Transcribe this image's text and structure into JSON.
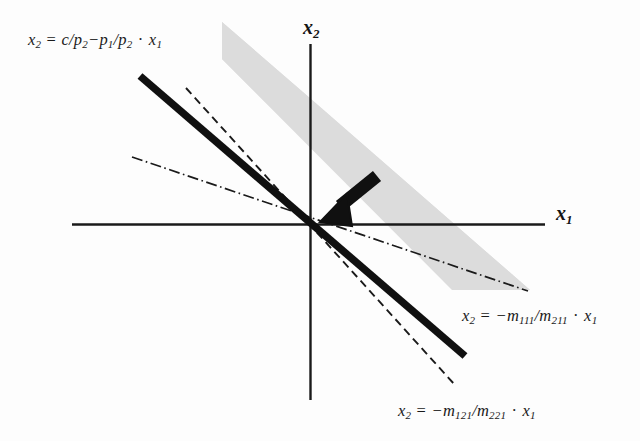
{
  "figure": {
    "background_color": "#fdfdfd",
    "ink_color": "#1a1a1a",
    "cone_fill_color": "#dcdcdc"
  },
  "axes": {
    "x_label_text": "x",
    "x_label_sub": "1",
    "y_label_text": "x",
    "y_label_sub": "2",
    "origin": {
      "x": 310,
      "y": 224
    },
    "x_axis": {
      "x1": 72,
      "y1": 224,
      "x2": 545,
      "y2": 224
    },
    "y_axis": {
      "x1": 310,
      "y1": 44,
      "x2": 310,
      "y2": 400
    }
  },
  "labels": {
    "budget_line": {
      "lhs": "x",
      "lhs_sub": "2",
      "equals": "=",
      "term1": "c/p",
      "term1_sub": "2",
      "minus": "−",
      "term2": "p",
      "term2_sub": "1",
      "slash": "/p",
      "term3_sub": "2",
      "dot": "·",
      "var": "x",
      "var_sub": "1",
      "full_text": "x2 = c/p2 − p1/p2 · x1"
    },
    "activity_ray_1": {
      "lhs": "x",
      "lhs_sub": "2",
      "equals": "=",
      "minus": "−",
      "num": "m",
      "num_sub": "111",
      "slash": "/",
      "den": "m",
      "den_sub": "211",
      "dot": "·",
      "var": "x",
      "var_sub": "1",
      "full_text": "x2 = −m111/m211 · x1"
    },
    "activity_ray_2": {
      "lhs": "x",
      "lhs_sub": "2",
      "equals": "=",
      "minus": "−",
      "num": "m",
      "num_sub": "121",
      "slash": "/",
      "den": "m",
      "den_sub": "221",
      "dot": "·",
      "var": "x",
      "var_sub": "1",
      "full_text": "x2 = −m121/m221 · x1"
    }
  },
  "graphics": {
    "cone": {
      "name": "feasible-cone",
      "points": "222,22 530,290 438,290 222,60",
      "fill": "#dcdcdc",
      "description": "shaded wedge between the two activity rays, opening to upper-left through origin"
    },
    "budget_line_segment": {
      "x1": 140,
      "y1": 76,
      "x2": 465,
      "y2": 356,
      "width": 7,
      "style": "solid"
    },
    "dashed_ray": {
      "x1": 186,
      "y1": 88,
      "x2": 455,
      "y2": 385,
      "width": 1.8,
      "style": "dashed"
    },
    "dashdot_ray": {
      "x1": 132,
      "y1": 157,
      "x2": 528,
      "y2": 291,
      "width": 1.6,
      "style": "dash-dot"
    },
    "arrow": {
      "x1": 376,
      "y1": 177,
      "x2": 325,
      "y2": 219,
      "width": 12,
      "direction": "down-left"
    }
  }
}
